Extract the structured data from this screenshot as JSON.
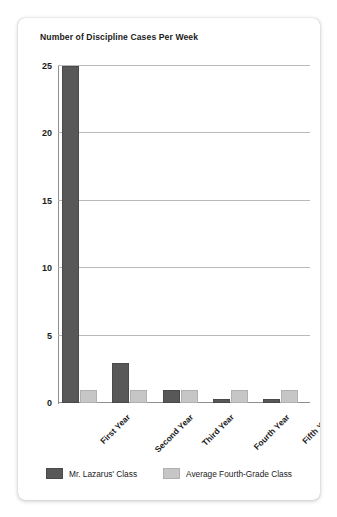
{
  "card": {
    "title": "Number of Discipline Cases Per Week"
  },
  "chart_data": {
    "type": "bar",
    "title": "Number of Discipline Cases Per Week",
    "xlabel": "",
    "ylabel": "",
    "ylim": [
      0,
      25
    ],
    "yticks": [
      0,
      5,
      10,
      15,
      20,
      25
    ],
    "grid": true,
    "legend_position": "bottom",
    "categories": [
      "First Year",
      "Second Year",
      "Third Year",
      "Fourth Year",
      "Fifth Year"
    ],
    "series": [
      {
        "name": "Mr. Lazarus' Class",
        "color": "#585858",
        "values": [
          25,
          3,
          1,
          0.3,
          0.3
        ]
      },
      {
        "name": "Average Fourth-Grade Class",
        "color": "#c6c6c6",
        "values": [
          1,
          1,
          1,
          1,
          1
        ]
      }
    ]
  }
}
